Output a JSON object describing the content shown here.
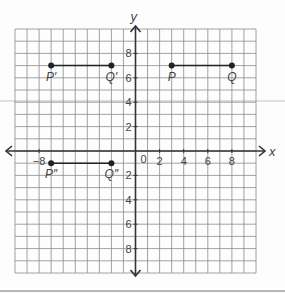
{
  "figure": {
    "axes": {
      "x_label": "x",
      "y_label": "y",
      "origin_label": "0",
      "x_ticks": [
        -8,
        2,
        4,
        6,
        8
      ],
      "x_tick_labels": [
        "−8",
        "2",
        "4",
        "6",
        "8"
      ],
      "y_ticks": [
        8,
        6,
        4,
        2,
        -2,
        -4,
        -6,
        -8
      ],
      "y_tick_labels": [
        "8",
        "6",
        "4",
        "2",
        "2",
        "4",
        "6",
        "8"
      ],
      "x_range": [
        -10,
        10
      ],
      "y_range": [
        -10,
        10
      ]
    },
    "points": [
      {
        "label": "P",
        "x": 3,
        "y": 7
      },
      {
        "label": "Q",
        "x": 8,
        "y": 7
      },
      {
        "label": "P′",
        "x": -7,
        "y": 7
      },
      {
        "label": "Q′",
        "x": -2,
        "y": 7
      },
      {
        "label": "P″",
        "x": -7,
        "y": -1
      },
      {
        "label": "Q″",
        "x": -2,
        "y": -1
      }
    ],
    "segments": [
      {
        "from": "P",
        "to": "Q"
      },
      {
        "from": "P′",
        "to": "Q′"
      },
      {
        "from": "P″",
        "to": "Q″"
      }
    ],
    "colors": {
      "grid": "#8a8a8a",
      "axis": "#333333",
      "point": "#222222",
      "text": "#444444"
    }
  }
}
